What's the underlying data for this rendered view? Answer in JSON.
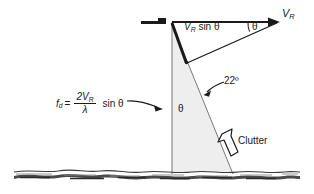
{
  "figure": {
    "type": "technical-diagram",
    "background_color": "#ffffff",
    "ink_color": "#1a1a1a",
    "triangle_fill_color": "#eeeeee"
  },
  "labels": {
    "vr_main": "V",
    "vr_main_sub": "R",
    "vr_sin": "V",
    "vr_sin_sub": "R",
    "vr_sin_rest": "sin θ",
    "theta_top": "θ",
    "theta_inner": "θ",
    "depression_angle": "22º",
    "clutter": "Clutter"
  },
  "formula": {
    "lhs": "f",
    "lhs_sub": "d",
    "equals": "=",
    "numerator": "2V",
    "numerator_sub": "R",
    "denominator": "λ",
    "trailing": "sin θ",
    "plain_text": "f_d = (2V_R / λ) sin θ"
  },
  "elements": {
    "antenna_symbol": "antenna-bar",
    "ground": "terrain-ground-line",
    "clutter_pointer": "hollow-block-arrow",
    "formula_pointer": "curved-arrow",
    "angle_pointer": "curved-arrow"
  }
}
